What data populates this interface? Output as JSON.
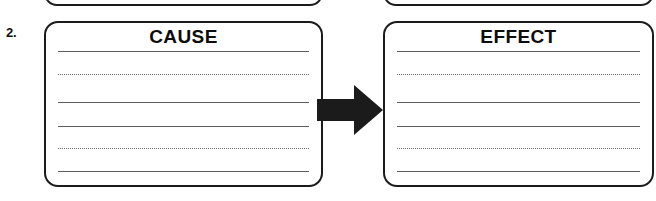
{
  "worksheet": {
    "item_number": "2.",
    "ink_color": "#1b1b1b",
    "rule_color": "#5e5e5e",
    "page_background": "#ffffff"
  },
  "previous_item": {
    "left_box_label": "",
    "right_box_label": ""
  },
  "organizer": {
    "cause": {
      "title": "CAUSE",
      "lines": [
        {
          "style": "solid"
        },
        {
          "style": "dotted"
        },
        {
          "style": "solid"
        },
        {
          "style": "solid"
        },
        {
          "style": "dotted"
        },
        {
          "style": "solid"
        }
      ],
      "written_text": ""
    },
    "effect": {
      "title": "EFFECT",
      "lines": [
        {
          "style": "solid"
        },
        {
          "style": "dotted"
        },
        {
          "style": "solid"
        },
        {
          "style": "solid"
        },
        {
          "style": "dotted"
        },
        {
          "style": "solid"
        }
      ],
      "written_text": ""
    },
    "connector": {
      "icon": "right-arrow-icon",
      "direction": "right",
      "color": "#1b1b1b"
    }
  }
}
